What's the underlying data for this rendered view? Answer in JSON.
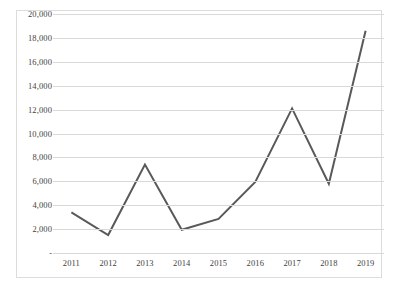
{
  "chart_data": {
    "type": "line",
    "title": "",
    "subtitle": "",
    "xlabel": "",
    "ylabel": "",
    "categories": [
      "2011",
      "2012",
      "2013",
      "2014",
      "2015",
      "2016",
      "2017",
      "2018",
      "2019"
    ],
    "values": [
      3400,
      1500,
      7400,
      1950,
      2850,
      5950,
      12100,
      5800,
      18600
    ],
    "series": [
      {
        "name": "",
        "values": [
          3400,
          1500,
          7400,
          1950,
          2850,
          5950,
          12100,
          5800,
          18600
        ],
        "color": "#595959"
      }
    ],
    "ylim": [
      0,
      20000
    ],
    "ytick_values": [
      0,
      2000,
      4000,
      6000,
      8000,
      10000,
      12000,
      14000,
      16000,
      18000,
      20000
    ],
    "ytick_labels": [
      "-",
      "2,000",
      "4,000",
      "6,000",
      "8,000",
      "10,000",
      "12,000",
      "14,000",
      "16,000",
      "18,000",
      "20,000"
    ],
    "grid": true,
    "grid_axis": "y",
    "legend": false,
    "legend_position": "none",
    "markers": false,
    "line_width": 2,
    "annotations": []
  },
  "style": {
    "line_color": "#595959",
    "gridline_color": "#d9d9d9",
    "frame_border_color": "#dcdcdc",
    "plot_background": "#ffffff",
    "tick_label_color": "#3f3f3f"
  }
}
